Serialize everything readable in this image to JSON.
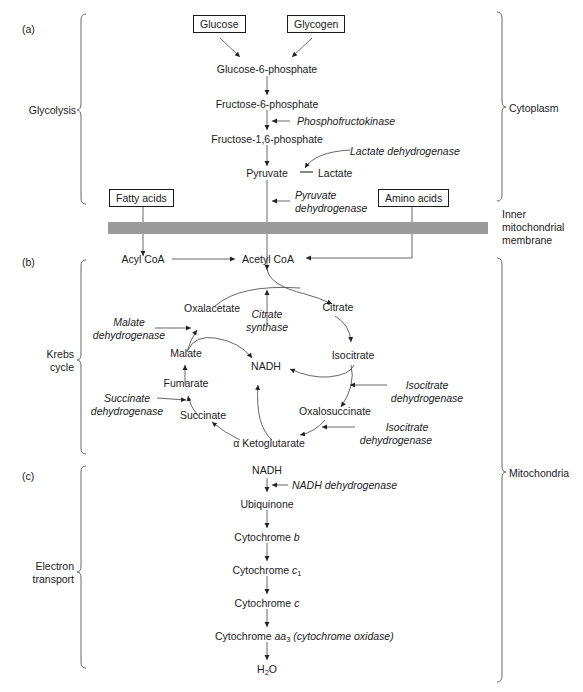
{
  "sections": {
    "a": {
      "label": "(a)",
      "bracket_label": "Glycolysis"
    },
    "b": {
      "label": "(b)",
      "bracket_label_line1": "Krebs",
      "bracket_label_line2": "cycle"
    },
    "c": {
      "label": "(c)",
      "bracket_label_line1": "Electron",
      "bracket_label_line2": "transport"
    }
  },
  "locations": {
    "cytoplasm": "Cytoplasm",
    "mitochondria": "Mitochondria",
    "membrane_line1": "Inner",
    "membrane_line2": "mitochondrial",
    "membrane_line3": "membrane"
  },
  "glycolysis": {
    "sources": [
      "Glucose",
      "Glycogen"
    ],
    "g6p": "Glucose-6-phosphate",
    "f6p": "Fructose-6-phosphate",
    "pfk": "Phosphofructokinase",
    "f16bp": "Fructose-1,6-phosphate",
    "ldh": "Lactate dehydrogenase",
    "pyruvate": "Pyruvate",
    "lactate": "Lactate",
    "pdh_line1": "Pyruvate",
    "pdh_line2": "dehydrogenase",
    "fatty_acids": "Fatty acids",
    "amino_acids": "Amino acids"
  },
  "krebs": {
    "acyl_coa": "Acyl CoA",
    "acetyl_coa": "Acetyl CoA",
    "oxalacetate": "Oxalacetate",
    "citrate_synthase_line1": "Citrate",
    "citrate_synthase_line2": "synthase",
    "citrate": "Citrate",
    "malate_dh_line1": "Malate",
    "malate_dh_line2": "dehydrogenase",
    "malate": "Malate",
    "nadh": "NADH",
    "isocitrate": "Isocitrate",
    "fumarate": "Fumarate",
    "succinate_dh_line1": "Succinate",
    "succinate_dh_line2": "dehydrogenase",
    "succinate": "Succinate",
    "icdh1_line1": "Isocitrate",
    "icdh1_line2": "dehydrogenase",
    "oxalosuccinate": "Oxalosuccinate",
    "icdh2_line1": "Isocitrate",
    "icdh2_line2": "dehydrogenase",
    "akg": "α Ketoglutarate"
  },
  "electron_transport": {
    "nadh": "NADH",
    "nadh_dh": "NADH dehydrogenase",
    "ubiquinone": "Ubiquinone",
    "cyt_b_prefix": "Cytochrome ",
    "cyt_b_italic": "b",
    "cyt_c1_prefix": "Cytochrome ",
    "cyt_c1_italic": "c",
    "cyt_c1_sub": "1",
    "cyt_c_prefix": "Cytochrome ",
    "cyt_c_italic": "c",
    "cyt_aa3_prefix": "Cytochrome ",
    "cyt_aa3_italic": "aa",
    "cyt_aa3_sub": "3",
    "cyt_aa3_suffix": " (cytochrome oxidase)",
    "water_prefix": "H",
    "water_sub": "2",
    "water_suffix": "O"
  }
}
